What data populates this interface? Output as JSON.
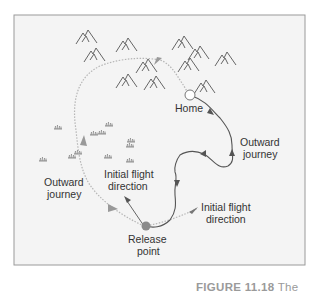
{
  "figure": {
    "labels": {
      "home": "Home",
      "outward_right_1": "Outward",
      "outward_right_2": "journey",
      "outward_left_1": "Outward",
      "outward_left_2": "journey",
      "initial_left_1": "Initial flight",
      "initial_left_2": "direction",
      "initial_right_1": "Initial flight",
      "initial_right_2": "direction",
      "release_1": "Release",
      "release_2": "point"
    },
    "icons": {
      "mountains": "mountain-icon",
      "grass": "grass-tuft-icon",
      "home_marker": "open-circle",
      "release_marker": "filled-circle"
    },
    "colors": {
      "frame": "#9a9a9a",
      "background": "#f4f4f4",
      "solid_path": "#555555",
      "dotted_path": "#b5b5b5",
      "release_dot": "#8a8a8a",
      "text": "#333333"
    }
  },
  "caption": {
    "number": "FIGURE 11.18",
    "text": "The"
  }
}
